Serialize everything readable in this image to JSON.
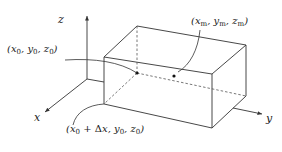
{
  "figure": {
    "type": "3d rectangular box with coordinate axes",
    "axes": {
      "x_label": "x",
      "y_label": "y",
      "z_label": "z"
    },
    "points": [
      {
        "id": "p0",
        "label": "(x0, y0, z0)",
        "parts": {
          "open": "(",
          "a": "x",
          "a_sub": "0",
          "b": "y",
          "b_sub": "0",
          "c": "z",
          "c_sub": "0",
          "close": ")"
        }
      },
      {
        "id": "pm",
        "label": "(xm, ym, zm)",
        "parts": {
          "open": "(",
          "a": "x",
          "a_sub": "m",
          "b": "y",
          "b_sub": "m",
          "c": "z",
          "c_sub": "m",
          "close": ")"
        }
      },
      {
        "id": "p1",
        "label": "(x0 + Δx, y0, z0)",
        "parts": {
          "open": "(",
          "a": "x",
          "a_sub": "0",
          "plus": " + Δ",
          "dx": "x",
          "b": "y",
          "b_sub": "0",
          "c": "z",
          "c_sub": "0",
          "close": ")"
        }
      }
    ],
    "colors": {
      "line": "#333333",
      "dashed": "#555555",
      "text": "#222222",
      "background": "#ffffff"
    }
  }
}
